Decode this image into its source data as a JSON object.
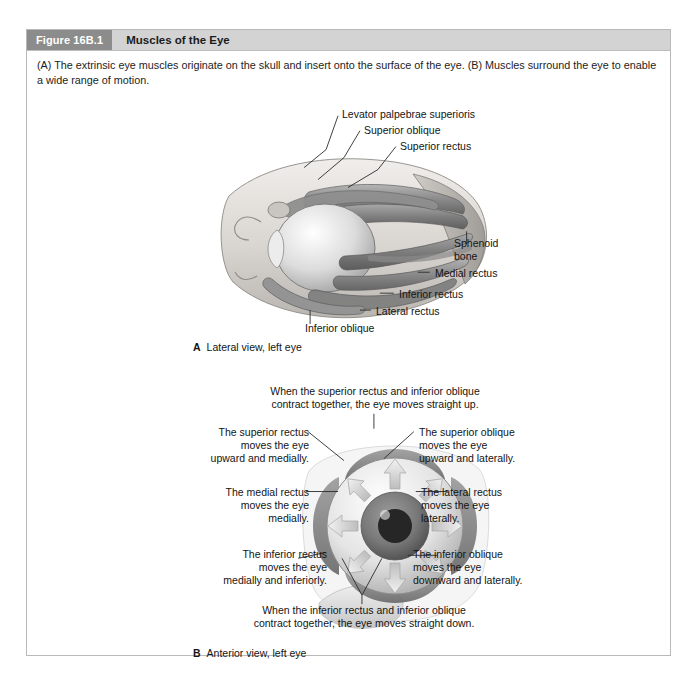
{
  "figure": {
    "number": "Figure 16B.1",
    "title": "Muscles of the Eye",
    "caption": "(A) The extrinsic eye muscles originate on the skull and insert onto the surface of the eye. (B) Muscles surround the eye to enable a wide range of motion."
  },
  "panel_a": {
    "letter": "A",
    "caption": "Lateral view, left eye",
    "labels": {
      "levator": "Levator palpebrae superioris",
      "superior_oblique": "Superior oblique",
      "superior_rectus": "Superior rectus",
      "sphenoid_bone": "Sphenoid\nbone",
      "medial_rectus": "Medial rectus",
      "inferior_rectus": "Inferior rectus",
      "lateral_rectus": "Lateral rectus",
      "inferior_oblique": "Inferior oblique"
    }
  },
  "panel_b": {
    "letter": "B",
    "caption": "Anterior view, left eye",
    "labels": {
      "top_note": "When the superior rectus and inferior oblique\ncontract together, the eye moves straight up.",
      "superior_rectus": "The superior rectus\nmoves the eye\nupward and medially.",
      "superior_oblique": "The superior oblique\nmoves the eye\nupward and laterally.",
      "medial_rectus": "The medial rectus\nmoves the eye\nmedially.",
      "lateral_rectus": "The lateral rectus\nmoves the eye\nlaterally.",
      "inferior_rectus": "The inferior rectus\nmoves the eye\nmedially and inferiorly.",
      "inferior_oblique": "The inferior oblique\nmoves the eye\ndownward and laterally.",
      "bottom_note": "When the inferior rectus and inferior oblique\ncontract together, the eye moves straight down."
    }
  },
  "colors": {
    "header_bar": "#d3d3d3",
    "figure_number_block": "#8c8c8c",
    "frame_border": "#b9b9b9",
    "text": "#141414",
    "iris": "#7a7a7a",
    "pupil": "#2b2b2b",
    "sclera": "#e9e9e9",
    "muscle_mid": "#9a9a9a",
    "muscle_dark": "#6e6e6e",
    "bone_light": "#d8d4cf"
  }
}
